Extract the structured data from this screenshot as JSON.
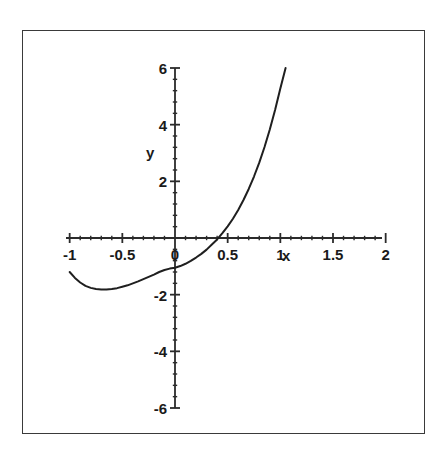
{
  "figure": {
    "background_color": "#ffffff",
    "frame_color": "#3a3a3a",
    "curve_color": "#1f1f1f",
    "axis_color": "#2b2b2b"
  },
  "chart_data": {
    "type": "line",
    "title": "",
    "subtitle": "",
    "xlabel": "x",
    "ylabel": "y",
    "xlim": [
      -1,
      2
    ],
    "ylim": [
      -6,
      6
    ],
    "grid": false,
    "legend": null,
    "x_ticks": [
      -1,
      -0.5,
      0,
      0.5,
      1,
      1.5,
      2
    ],
    "x_tick_labels": [
      "-1",
      "-0.5",
      "0",
      "0.5",
      "1",
      "1.5",
      "2"
    ],
    "y_ticks": [
      -6,
      -4,
      -2,
      0,
      2,
      4,
      6
    ],
    "y_tick_labels": [
      "-6",
      "-4",
      "-2",
      "0",
      "2",
      "4",
      "6"
    ],
    "x_minor_tick_step": 0.1,
    "y_minor_tick_step": 0.4,
    "axes_style": "centered-crosshair",
    "series": [
      {
        "name": "curve",
        "color": "#1f1f1f",
        "line_width": 2,
        "x": [
          -1.0,
          -0.95,
          -0.9,
          -0.85,
          -0.8,
          -0.75,
          -0.7,
          -0.65,
          -0.6,
          -0.55,
          -0.5,
          -0.45,
          -0.4,
          -0.35,
          -0.3,
          -0.25,
          -0.2,
          -0.15,
          -0.1,
          -0.05,
          0.0,
          0.05,
          0.1,
          0.15,
          0.2,
          0.25,
          0.3,
          0.35,
          0.4,
          0.45,
          0.5,
          0.55,
          0.6,
          0.65,
          0.7,
          0.75,
          0.8,
          0.85,
          0.9,
          0.95,
          1.0,
          1.05
        ],
        "y": [
          -1.2,
          -1.41,
          -1.57,
          -1.69,
          -1.76,
          -1.8,
          -1.82,
          -1.82,
          -1.8,
          -1.77,
          -1.72,
          -1.67,
          -1.6,
          -1.53,
          -1.45,
          -1.37,
          -1.29,
          -1.2,
          -1.13,
          -1.08,
          -1.05,
          -0.99,
          -0.91,
          -0.81,
          -0.69,
          -0.56,
          -0.41,
          -0.23,
          -0.05,
          0.17,
          0.41,
          0.68,
          0.99,
          1.34,
          1.73,
          2.17,
          2.66,
          3.21,
          3.83,
          4.52,
          5.28,
          6.0
        ]
      }
    ]
  },
  "labels": {
    "y_axis_label": "y",
    "x_axis_label": "x"
  }
}
